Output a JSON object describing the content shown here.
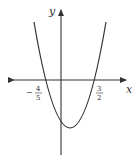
{
  "diagram": {
    "type": "parabola-graph",
    "axes": {
      "x_label": "x",
      "y_label": "y"
    },
    "roots": [
      {
        "minus": "−",
        "num": "4",
        "den": "5"
      },
      {
        "minus": "",
        "num": "3",
        "den": "2"
      }
    ],
    "colors": {
      "axis": "#333333",
      "curve": "#333333",
      "background": "#ffffff"
    }
  }
}
